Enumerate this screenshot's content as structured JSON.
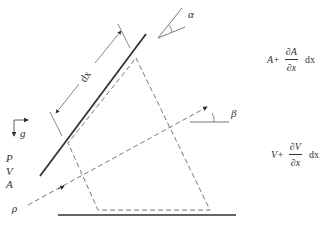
{
  "diagram": {
    "labels": {
      "dx": "dx",
      "alpha": "α",
      "beta": "β",
      "g": "g",
      "P": "P",
      "V": "V",
      "A": "A",
      "rho": "ρ"
    },
    "equations": {
      "area": {
        "base": "A+",
        "numerator": "∂A",
        "denominator": "∂x",
        "suffix": "dx"
      },
      "velocity": {
        "base": "V+",
        "numerator": "∂V",
        "denominator": "∂x",
        "suffix": "dx"
      }
    },
    "colors": {
      "stroke": "#333333",
      "background": "#ffffff"
    }
  }
}
